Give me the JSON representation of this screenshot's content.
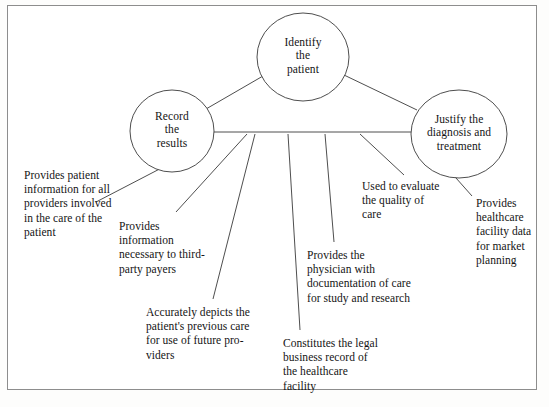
{
  "figure": {
    "kind": "concept-diagram",
    "border_color": "#8d8d8d",
    "line_color": "#3a3a3a",
    "background": "#ffffff"
  },
  "nodes": [
    {
      "id": "identify",
      "name": "identify-the-patient",
      "lines": [
        "Identify",
        "the",
        "patient"
      ],
      "cx": 303,
      "cy": 57,
      "rx": 46,
      "ry": 44
    },
    {
      "id": "record",
      "name": "record-the-results",
      "lines": [
        "Record",
        "the",
        "results"
      ],
      "cx": 172,
      "cy": 131,
      "rx": 42,
      "ry": 41
    },
    {
      "id": "justify",
      "name": "justify-the-diagnosis-and-treatment",
      "lines": [
        "Justify the",
        "diagnosis and",
        "treatment"
      ],
      "cx": 459,
      "cy": 134,
      "rx": 48,
      "ry": 44
    }
  ],
  "callouts": [
    {
      "id": "c1",
      "name": "callout-provider-information",
      "text": "Provides patient information for all providers involved in the care of the patient",
      "x": 24,
      "y": 168,
      "width": 96
    },
    {
      "id": "c2",
      "name": "callout-third-party-payers",
      "text": "Provides information necessary to third-party payers",
      "x": 119,
      "y": 219,
      "width": 86
    },
    {
      "id": "c3",
      "name": "callout-previous-care",
      "text": "Accurately depicts the patient's previous care for use of future pro-viders",
      "x": 146,
      "y": 305,
      "width": 108
    },
    {
      "id": "c4",
      "name": "callout-legal-business-record",
      "text": "Constitutes the legal business record of the healthcare facility",
      "x": 283,
      "y": 336,
      "width": 96
    },
    {
      "id": "c5",
      "name": "callout-physician-documentation",
      "text": "Provides the physician with documentation of care for study and research",
      "x": 307,
      "y": 248,
      "width": 104
    },
    {
      "id": "c6",
      "name": "callout-quality-of-care",
      "text": "Used to evaluate the quality of care",
      "x": 362,
      "y": 179,
      "width": 78
    },
    {
      "id": "c7",
      "name": "callout-market-planning",
      "text": "Provides healthcare facility data for market planning",
      "x": 476,
      "y": 196,
      "width": 62
    }
  ],
  "connectors": {
    "node_links": [
      {
        "name": "link-record-to-identify",
        "x1": 206,
        "y1": 109,
        "x2": 263,
        "y2": 76
      },
      {
        "name": "link-identify-to-justify",
        "x1": 344,
        "y1": 75,
        "x2": 417,
        "y2": 110
      },
      {
        "name": "link-record-to-justify",
        "x1": 214,
        "y1": 132,
        "x2": 411,
        "y2": 132
      }
    ],
    "leader_lines": [
      {
        "name": "leader-provider-information",
        "x1": 200,
        "y1": 148,
        "x2": 96,
        "y2": 202
      },
      {
        "name": "leader-third-party-payers",
        "x1": 247,
        "y1": 134,
        "x2": 176,
        "y2": 212
      },
      {
        "name": "leader-previous-care",
        "x1": 255,
        "y1": 134,
        "x2": 213,
        "y2": 299
      },
      {
        "name": "leader-legal-business-record",
        "x1": 288,
        "y1": 134,
        "x2": 300,
        "y2": 330
      },
      {
        "name": "leader-physician-documentation",
        "x1": 325,
        "y1": 134,
        "x2": 334,
        "y2": 242
      },
      {
        "name": "leader-quality-of-care",
        "x1": 360,
        "y1": 134,
        "x2": 404,
        "y2": 175
      },
      {
        "name": "leader-market-planning",
        "x1": 440,
        "y1": 160,
        "x2": 472,
        "y2": 196
      }
    ]
  }
}
